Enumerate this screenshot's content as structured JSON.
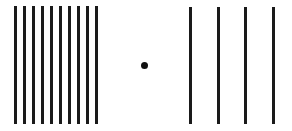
{
  "figure": {
    "background": "#ffffff",
    "line_color": "#1a1a1a",
    "left_group": {
      "count": 10,
      "x_positions": [
        14,
        23,
        32,
        41,
        50,
        59,
        68,
        77,
        86,
        95
      ],
      "top": 6,
      "bottom": 124
    },
    "fixation_dot": {
      "x": 144,
      "y": 65,
      "diameter": 7,
      "color": "#111111"
    },
    "right_group": {
      "count": 4,
      "x_positions": [
        189,
        217,
        244,
        272
      ],
      "top": 7,
      "bottom": 124
    }
  }
}
